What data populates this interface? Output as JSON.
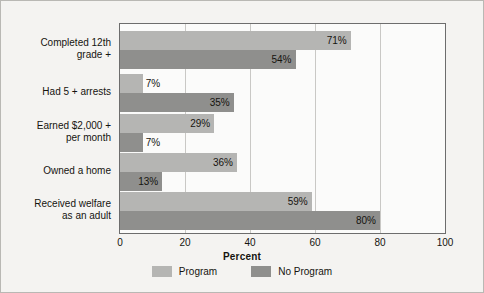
{
  "chart_data": {
    "type": "bar",
    "orientation": "horizontal",
    "title": "",
    "xlabel": "Percent",
    "ylabel": "",
    "xlim": [
      0,
      100
    ],
    "xticks": [
      0,
      20,
      40,
      60,
      80,
      100
    ],
    "grid": true,
    "legend_position": "bottom",
    "categories": [
      "Completed 12th grade +",
      "Had 5 + arrests",
      "Earned $2,000 + per month",
      "Owned a home",
      "Received welfare as an adult"
    ],
    "category_lines": [
      [
        "Completed 12th",
        "grade +"
      ],
      [
        "Had 5 + arrests"
      ],
      [
        "Earned $2,000 +",
        "per month"
      ],
      [
        "Owned a home"
      ],
      [
        "Received welfare",
        "as an adult"
      ]
    ],
    "series": [
      {
        "name": "Program",
        "color": "#b5b5b3",
        "values": [
          71,
          7,
          29,
          36,
          59
        ],
        "labels": [
          "71%",
          "7%",
          "29%",
          "36%",
          "59%"
        ]
      },
      {
        "name": "No Program",
        "color": "#8f8f8d",
        "values": [
          54,
          35,
          7,
          13,
          80
        ],
        "labels": [
          "54%",
          "35%",
          "7%",
          "13%",
          "80%"
        ]
      }
    ]
  },
  "axis": {
    "tick_labels": [
      "0",
      "20",
      "40",
      "60",
      "80",
      "100"
    ],
    "x_title": "Percent"
  },
  "legend": {
    "items": [
      {
        "label": "Program",
        "color": "#b5b5b3"
      },
      {
        "label": "No Program",
        "color": "#8f8f8d"
      }
    ]
  },
  "colors": {
    "background": "#f4f3f1",
    "plot_background": "#fbfbfa",
    "frame": "#6d6d6d",
    "gridline": "#c9c8c5",
    "text": "#15140f",
    "program": "#b5b5b3",
    "no_program": "#8f8f8d"
  }
}
